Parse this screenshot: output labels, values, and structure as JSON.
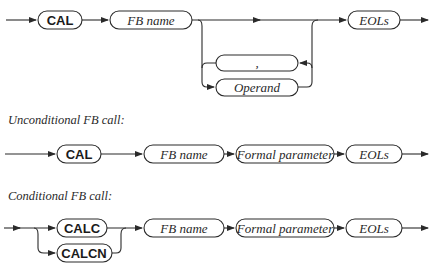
{
  "diagram1": {
    "keyword": "CAL",
    "fb_name": "FB name",
    "separator": ",",
    "operand": "Operand",
    "eols": "EOLs"
  },
  "diagram2": {
    "caption": "Unconditional FB call:",
    "keyword": "CAL",
    "fb_name": "FB name",
    "formal_parameter": "Formal parameter",
    "eols": "EOLs"
  },
  "diagram3": {
    "caption": "Conditional FB call:",
    "keyword_1": "CALC",
    "keyword_2": "CALCN",
    "fb_name": "FB name",
    "formal_parameter": "Formal parameter",
    "eols": "EOLs"
  },
  "colors": {
    "stroke": "#2a2a2a",
    "background": "#ffffff"
  }
}
